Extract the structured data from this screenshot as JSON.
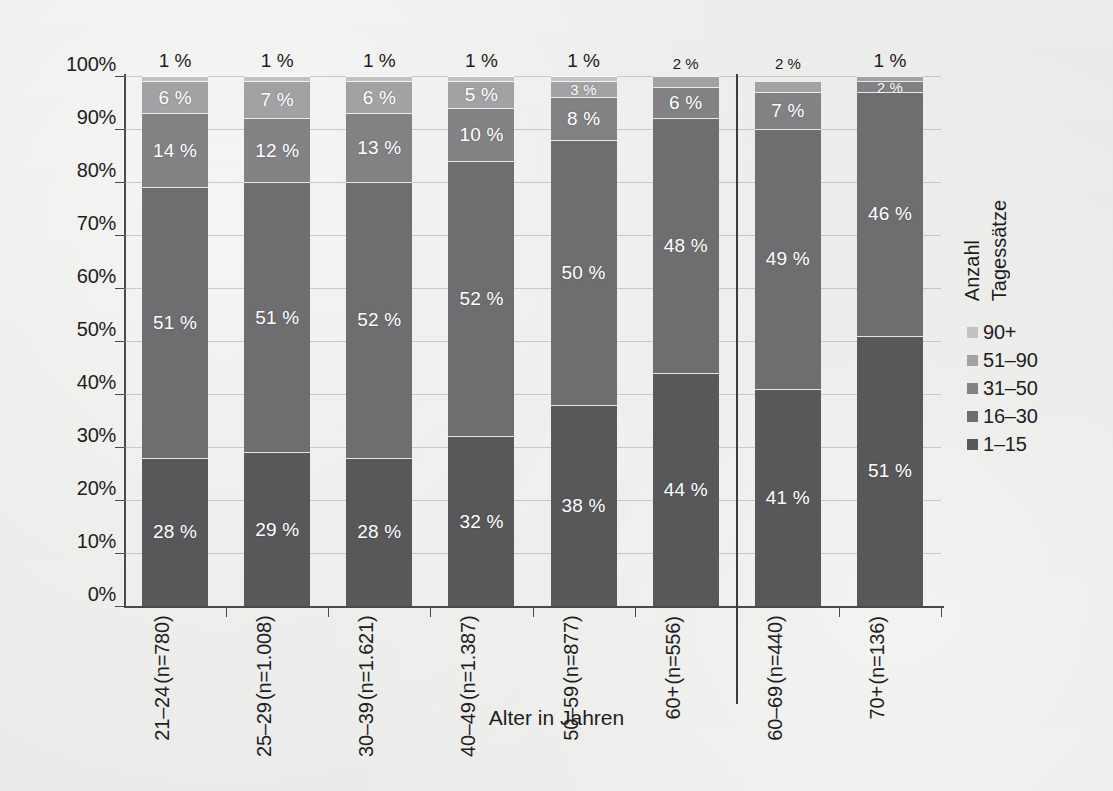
{
  "chart_data": {
    "type": "bar",
    "subtype": "stacked-percentage-column",
    "title": "",
    "xlabel": "Alter in Jahren",
    "ylabel": "",
    "ylim": [
      0,
      100
    ],
    "ytick_labels": [
      "0%",
      "10%",
      "20%",
      "30%",
      "40%",
      "50%",
      "60%",
      "70%",
      "80%",
      "90%",
      "100%"
    ],
    "ytick_values": [
      0,
      10,
      20,
      30,
      40,
      50,
      60,
      70,
      80,
      90,
      100
    ],
    "grid": true,
    "legend_position": "right",
    "legend_title_lines": [
      "Anzahl",
      "Tagessätze"
    ],
    "categories": [
      "21–24\n(n=780)",
      "25–29\n(n=1.008)",
      "30–39\n(n=1.621)",
      "40–49\n(n=1.387)",
      "50–59\n(n=877)",
      "60+\n(n=556)",
      "60–69\n(n=440)",
      "70+\n(n=136)"
    ],
    "category_labels": [
      {
        "range": "21–24",
        "count": "(n=780)"
      },
      {
        "range": "25–29",
        "count": "(n=1.008)"
      },
      {
        "range": "30–39",
        "count": "(n=1.621)"
      },
      {
        "range": "40–49",
        "count": "(n=1.387)"
      },
      {
        "range": "50–59",
        "count": "(n=877)"
      },
      {
        "range": "60+",
        "count": "(n=556)"
      },
      {
        "range": "60–69",
        "count": "(n=440)"
      },
      {
        "range": "70+",
        "count": "(n=136)"
      }
    ],
    "series": [
      {
        "name": "1–15",
        "color": "#58585a",
        "values": [
          28,
          29,
          28,
          32,
          38,
          44,
          41,
          51
        ]
      },
      {
        "name": "16–30",
        "color": "#6e6e70",
        "values": [
          51,
          51,
          52,
          52,
          50,
          48,
          49,
          46
        ]
      },
      {
        "name": "31–50",
        "color": "#828285",
        "values": [
          14,
          12,
          13,
          10,
          8,
          6,
          7,
          2
        ]
      },
      {
        "name": "51–90",
        "color": "#a2a2a4",
        "values": [
          6,
          7,
          6,
          5,
          3,
          2,
          2,
          1
        ]
      },
      {
        "name": "90+",
        "color": "#c2c2c3",
        "values": [
          1,
          1,
          1,
          1,
          1,
          0,
          0,
          0
        ]
      }
    ],
    "bar_labels": [
      {
        "category": "21–24",
        "labels": [
          {
            "series": "1–15",
            "text": "28 %"
          },
          {
            "series": "16–30",
            "text": "51 %"
          },
          {
            "series": "31–50",
            "text": "14 %"
          },
          {
            "series": "51–90",
            "text": "6 %"
          },
          {
            "series": "90+",
            "text": "1 %",
            "outside": true
          }
        ]
      },
      {
        "category": "25–29",
        "labels": [
          {
            "series": "1–15",
            "text": "29 %"
          },
          {
            "series": "16–30",
            "text": "51 %"
          },
          {
            "series": "31–50",
            "text": "12 %"
          },
          {
            "series": "51–90",
            "text": "7 %"
          },
          {
            "series": "90+",
            "text": "1 %",
            "outside": true
          }
        ]
      },
      {
        "category": "30–39",
        "labels": [
          {
            "series": "1–15",
            "text": "28 %"
          },
          {
            "series": "16–30",
            "text": "52 %"
          },
          {
            "series": "31–50",
            "text": "13 %"
          },
          {
            "series": "51–90",
            "text": "6 %"
          },
          {
            "series": "90+",
            "text": "1 %",
            "outside": true
          }
        ]
      },
      {
        "category": "40–49",
        "labels": [
          {
            "series": "1–15",
            "text": "32 %"
          },
          {
            "series": "16–30",
            "text": "52 %"
          },
          {
            "series": "31–50",
            "text": "10 %"
          },
          {
            "series": "51–90",
            "text": "5 %"
          },
          {
            "series": "90+",
            "text": "1 %",
            "outside": true
          }
        ]
      },
      {
        "category": "50–59",
        "labels": [
          {
            "series": "1–15",
            "text": "38 %"
          },
          {
            "series": "16–30",
            "text": "50 %"
          },
          {
            "series": "31–50",
            "text": "8 %"
          },
          {
            "series": "51–90",
            "text": "3 %"
          },
          {
            "series": "90+",
            "text": "1 %",
            "outside": true
          }
        ]
      },
      {
        "category": "60+",
        "labels": [
          {
            "series": "1–15",
            "text": "44 %"
          },
          {
            "series": "16–30",
            "text": "48 %"
          },
          {
            "series": "31–50",
            "text": "6 %"
          },
          {
            "series": "51–90",
            "text": "2 %",
            "outside": true
          }
        ]
      },
      {
        "category": "60–69",
        "labels": [
          {
            "series": "1–15",
            "text": "41 %"
          },
          {
            "series": "16–30",
            "text": "49 %"
          },
          {
            "series": "31–50",
            "text": "7 %"
          },
          {
            "series": "51–90",
            "text": "2 %",
            "outside": true
          }
        ]
      },
      {
        "category": "70+",
        "labels": [
          {
            "series": "1–15",
            "text": "51 %"
          },
          {
            "series": "16–30",
            "text": "46 %"
          },
          {
            "series": "31–50",
            "text": "2 %"
          },
          {
            "series": "90+",
            "text": "1 %",
            "outside": true
          }
        ]
      }
    ],
    "annotations": [
      {
        "type": "group-divider",
        "after_category": "60+",
        "note": "vertical rule separating 60+ from 60–69 / 70+"
      }
    ]
  },
  "axis": {
    "x_title": "Alter in Jahren"
  },
  "legend": {
    "title_line1": "Anzahl",
    "title_line2": "Tagessätze",
    "items": [
      {
        "label": "90+",
        "color": "#c2c2c3"
      },
      {
        "label": "51–90",
        "color": "#a2a2a4"
      },
      {
        "label": "31–50",
        "color": "#828285"
      },
      {
        "label": "16–30",
        "color": "#6e6e70"
      },
      {
        "label": "1–15",
        "color": "#58585a"
      }
    ]
  },
  "ticks": {
    "y": [
      "100%",
      "90%",
      "80%",
      "70%",
      "60%",
      "50%",
      "40%",
      "30%",
      "20%",
      "10%",
      "0%"
    ]
  }
}
